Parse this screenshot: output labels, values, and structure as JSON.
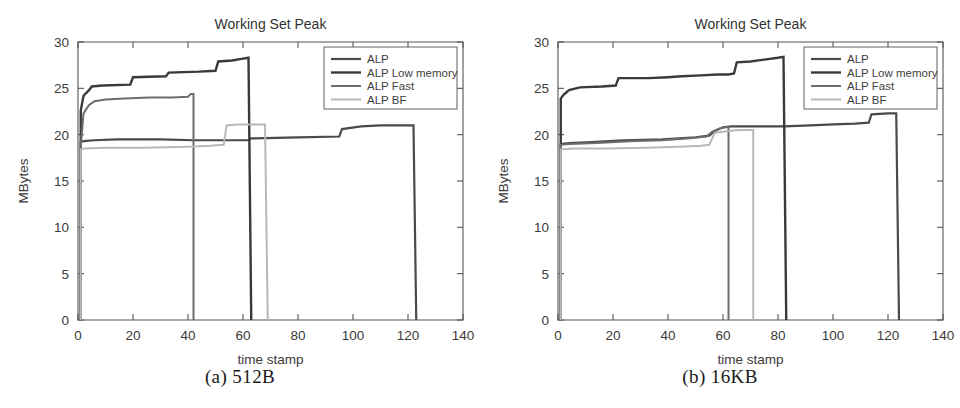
{
  "figure": {
    "panels": [
      {
        "caption": "(a) 512B",
        "chart_data": {
          "type": "line",
          "title": "Working Set Peak",
          "xlabel": "time stamp",
          "ylabel": "MBytes",
          "xlim": [
            0,
            140
          ],
          "ylim": [
            0,
            30
          ],
          "xticks": [
            0,
            20,
            40,
            60,
            80,
            100,
            120,
            140
          ],
          "yticks": [
            0,
            5,
            10,
            15,
            20,
            25,
            30
          ],
          "grid": false,
          "legend_position": "top-right",
          "series": [
            {
              "name": "ALP",
              "color": "#4a4a4a",
              "width": 2.2,
              "points": [
                [
                  1,
                  0
                ],
                [
                  1,
                  19.2
                ],
                [
                  2,
                  19.3
                ],
                [
                  6,
                  19.4
                ],
                [
                  14,
                  19.5
                ],
                [
                  30,
                  19.5
                ],
                [
                  42,
                  19.4
                ],
                [
                  55,
                  19.4
                ],
                [
                  62,
                  19.4
                ],
                [
                  63,
                  19.6
                ],
                [
                  80,
                  19.7
                ],
                [
                  95,
                  19.8
                ],
                [
                  96,
                  20.6
                ],
                [
                  103,
                  20.9
                ],
                [
                  110,
                  21.0
                ],
                [
                  122,
                  21.0
                ],
                [
                  123,
                  0
                ]
              ]
            },
            {
              "name": "ALP Low memory",
              "color": "#3a3a3a",
              "width": 2.4,
              "points": [
                [
                  1,
                  0
                ],
                [
                  1,
                  22.6
                ],
                [
                  2,
                  24.2
                ],
                [
                  4,
                  24.8
                ],
                [
                  5,
                  25.2
                ],
                [
                  9,
                  25.3
                ],
                [
                  19,
                  25.4
                ],
                [
                  20,
                  26.2
                ],
                [
                  32,
                  26.3
                ],
                [
                  33,
                  26.7
                ],
                [
                  44,
                  26.8
                ],
                [
                  50,
                  26.9
                ],
                [
                  51,
                  27.9
                ],
                [
                  56,
                  28.0
                ],
                [
                  60,
                  28.2
                ],
                [
                  62,
                  28.3
                ],
                [
                  63,
                  0
                ]
              ]
            },
            {
              "name": "ALP Fast",
              "color": "#6d6d6d",
              "width": 2.0,
              "points": [
                [
                  1,
                  0
                ],
                [
                  1,
                  18.7
                ],
                [
                  2,
                  22.3
                ],
                [
                  4,
                  23.2
                ],
                [
                  6,
                  23.6
                ],
                [
                  10,
                  23.8
                ],
                [
                  17,
                  23.9
                ],
                [
                  26,
                  24.0
                ],
                [
                  34,
                  24.0
                ],
                [
                  40,
                  24.1
                ],
                [
                  41,
                  24.4
                ],
                [
                  42,
                  24.4
                ],
                [
                  42,
                  0
                ]
              ]
            },
            {
              "name": "ALP BF",
              "color": "#b8b8b8",
              "width": 2.0,
              "points": [
                [
                  1,
                  0
                ],
                [
                  1,
                  18.4
                ],
                [
                  2,
                  18.5
                ],
                [
                  10,
                  18.6
                ],
                [
                  24,
                  18.6
                ],
                [
                  40,
                  18.7
                ],
                [
                  48,
                  18.8
                ],
                [
                  53,
                  18.9
                ],
                [
                  54,
                  21.0
                ],
                [
                  58,
                  21.1
                ],
                [
                  62,
                  21.1
                ],
                [
                  66,
                  21.1
                ],
                [
                  68,
                  21.1
                ],
                [
                  69,
                  0
                ]
              ]
            }
          ]
        }
      },
      {
        "caption": "(b) 16KB",
        "chart_data": {
          "type": "line",
          "title": "Working Set Peak",
          "xlabel": "time stamp",
          "ylabel": "MBytes",
          "xlim": [
            0,
            140
          ],
          "ylim": [
            0,
            30
          ],
          "xticks": [
            0,
            20,
            40,
            60,
            80,
            100,
            120,
            140
          ],
          "yticks": [
            0,
            5,
            10,
            15,
            20,
            25,
            30
          ],
          "grid": false,
          "legend_position": "top-right",
          "series": [
            {
              "name": "ALP",
              "color": "#4a4a4a",
              "width": 2.2,
              "points": [
                [
                  1,
                  0
                ],
                [
                  1,
                  19.0
                ],
                [
                  4,
                  19.1
                ],
                [
                  12,
                  19.2
                ],
                [
                  24,
                  19.4
                ],
                [
                  38,
                  19.5
                ],
                [
                  50,
                  19.7
                ],
                [
                  55,
                  19.9
                ],
                [
                  57,
                  20.4
                ],
                [
                  60,
                  20.8
                ],
                [
                  63,
                  20.9
                ],
                [
                  72,
                  20.9
                ],
                [
                  82,
                  20.9
                ],
                [
                  92,
                  21.0
                ],
                [
                  100,
                  21.1
                ],
                [
                  108,
                  21.2
                ],
                [
                  113,
                  21.3
                ],
                [
                  114,
                  22.2
                ],
                [
                  120,
                  22.3
                ],
                [
                  123,
                  22.3
                ],
                [
                  124,
                  0
                ]
              ]
            },
            {
              "name": "ALP Low memory",
              "color": "#3a3a3a",
              "width": 2.4,
              "points": [
                [
                  1,
                  0
                ],
                [
                  1,
                  23.9
                ],
                [
                  2,
                  24.3
                ],
                [
                  4,
                  24.8
                ],
                [
                  8,
                  25.1
                ],
                [
                  16,
                  25.2
                ],
                [
                  21,
                  25.3
                ],
                [
                  22,
                  26.1
                ],
                [
                  33,
                  26.1
                ],
                [
                  40,
                  26.2
                ],
                [
                  45,
                  26.3
                ],
                [
                  52,
                  26.4
                ],
                [
                  58,
                  26.5
                ],
                [
                  62,
                  26.5
                ],
                [
                  64,
                  26.6
                ],
                [
                  65,
                  27.8
                ],
                [
                  70,
                  27.9
                ],
                [
                  75,
                  28.1
                ],
                [
                  80,
                  28.3
                ],
                [
                  82,
                  28.4
                ],
                [
                  83,
                  0
                ]
              ]
            },
            {
              "name": "ALP Fast",
              "color": "#6d6d6d",
              "width": 2.0,
              "points": [
                [
                  1,
                  0
                ],
                [
                  1,
                  18.9
                ],
                [
                  4,
                  19.0
                ],
                [
                  14,
                  19.1
                ],
                [
                  26,
                  19.3
                ],
                [
                  38,
                  19.4
                ],
                [
                  48,
                  19.6
                ],
                [
                  54,
                  19.8
                ],
                [
                  56,
                  20.3
                ],
                [
                  59,
                  20.7
                ],
                [
                  61,
                  20.8
                ],
                [
                  62,
                  20.8
                ],
                [
                  62,
                  0
                ]
              ]
            },
            {
              "name": "ALP BF",
              "color": "#b8b8b8",
              "width": 2.0,
              "points": [
                [
                  1,
                  0
                ],
                [
                  1,
                  18.4
                ],
                [
                  6,
                  18.5
                ],
                [
                  18,
                  18.5
                ],
                [
                  32,
                  18.6
                ],
                [
                  44,
                  18.7
                ],
                [
                  52,
                  18.8
                ],
                [
                  55,
                  18.9
                ],
                [
                  57,
                  20.2
                ],
                [
                  62,
                  20.4
                ],
                [
                  66,
                  20.5
                ],
                [
                  70,
                  20.5
                ],
                [
                  71,
                  20.5
                ],
                [
                  71,
                  0
                ]
              ]
            }
          ]
        }
      }
    ]
  }
}
